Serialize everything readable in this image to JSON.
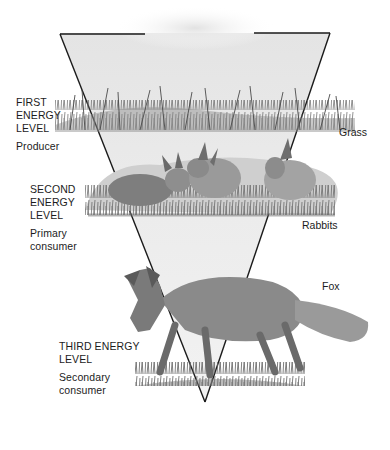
{
  "diagram": {
    "type": "energy-pyramid (inverted triangle food chain)",
    "levels": [
      {
        "title_lines": [
          "FIRST",
          "ENERGY",
          "LEVEL"
        ],
        "role": "Producer",
        "organism": "Grass"
      },
      {
        "title_lines": [
          "SECOND",
          "ENERGY",
          "LEVEL"
        ],
        "role_lines": [
          "Primary",
          "consumer"
        ],
        "organism": "Rabbits"
      },
      {
        "title_lines": [
          "THIRD ENERGY",
          "LEVEL"
        ],
        "role_lines": [
          "Secondary",
          "consumer"
        ],
        "organism": "Fox"
      }
    ]
  },
  "colors": {
    "outline": "#1a1a1a",
    "triangle_fill": "#e9e9e9",
    "text": "#1c1c1c",
    "grass_dark": "#5a5a5a",
    "grass_light": "#9a9a9a",
    "animal_fur": "#7d7d7d"
  }
}
